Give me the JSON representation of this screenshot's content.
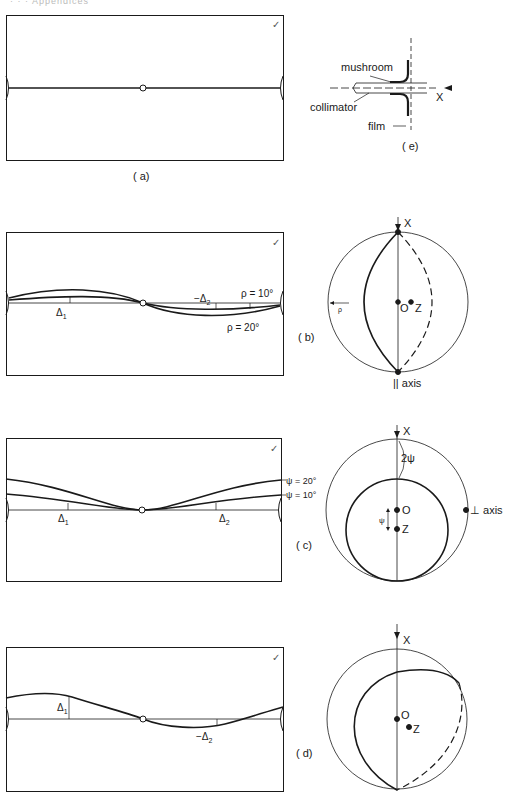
{
  "header": {
    "text": "· · ·        Appendices"
  },
  "figure": {
    "panels": [
      {
        "id": "a",
        "label": "( a)",
        "check": "✓"
      },
      {
        "id": "b",
        "label": "( b)",
        "check": "✓",
        "annotations": {
          "delta1": "Δ",
          "delta1_sub": "1",
          "delta2": "−Δ",
          "delta2_sub": "2",
          "rho10": "ρ = 10°",
          "rho20": "ρ = 20°",
          "rho": "ρ"
        },
        "circle": {
          "x": "X",
          "o": "O",
          "z": "Z",
          "axis": "|| axis"
        }
      },
      {
        "id": "c",
        "label": "( c)",
        "check": "✓",
        "annotations": {
          "delta1": "Δ",
          "delta1_sub": "1",
          "delta2": "Δ",
          "delta2_sub": "2",
          "psi20": "ψ = 20°",
          "psi10": "ψ = 10°"
        },
        "circle": {
          "x": "X",
          "o": "O",
          "z": "Z",
          "two_psi": "2ψ",
          "psi": "ψ",
          "axis": "⊥ axis"
        }
      },
      {
        "id": "d",
        "label": "( d)",
        "check": "✓",
        "annotations": {
          "delta1": "Δ",
          "delta1_sub": "1",
          "delta2": "−Δ",
          "delta2_sub": "2"
        },
        "circle": {
          "x": "X",
          "o": "O",
          "z": "Z"
        }
      },
      {
        "id": "e",
        "label": "( e)",
        "parts": {
          "mushroom": "mushroom",
          "collimator": "collimator",
          "film": "film",
          "x": "X"
        }
      }
    ]
  }
}
